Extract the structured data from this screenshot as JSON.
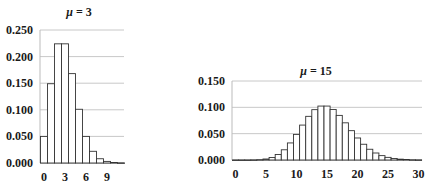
{
  "chart_data": [
    {
      "type": "bar",
      "title": "μ = 3",
      "title_mu": "μ",
      "title_value": "= 3",
      "xlabel": "",
      "ylabel": "",
      "ylim": [
        0,
        0.25
      ],
      "yticks": [
        "0.000",
        "0.050",
        "0.100",
        "0.150",
        "0.200",
        "0.250"
      ],
      "xticks": [
        "0",
        "3",
        "6",
        "9"
      ],
      "grid": true,
      "categories": [
        0,
        1,
        2,
        3,
        4,
        5,
        6,
        7,
        8,
        9,
        10,
        11
      ],
      "values": [
        0.05,
        0.149,
        0.224,
        0.224,
        0.168,
        0.101,
        0.05,
        0.022,
        0.008,
        0.003,
        0.001,
        0.0002
      ]
    },
    {
      "type": "bar",
      "title": "μ = 15",
      "title_mu": "μ",
      "title_value": "= 15",
      "xlabel": "",
      "ylabel": "",
      "ylim": [
        0,
        0.15
      ],
      "yticks": [
        "0.000",
        "0.050",
        "0.100",
        "0.150"
      ],
      "xticks": [
        "0",
        "5",
        "10",
        "15",
        "20",
        "25",
        "30"
      ],
      "grid": true,
      "categories": [
        0,
        1,
        2,
        3,
        4,
        5,
        6,
        7,
        8,
        9,
        10,
        11,
        12,
        13,
        14,
        15,
        16,
        17,
        18,
        19,
        20,
        21,
        22,
        23,
        24,
        25,
        26,
        27,
        28,
        29,
        30
      ],
      "values": [
        0.0,
        0.0,
        0.0,
        0.0002,
        0.0006,
        0.0019,
        0.0048,
        0.0104,
        0.0194,
        0.0324,
        0.0486,
        0.0663,
        0.0829,
        0.0956,
        0.1024,
        0.1024,
        0.096,
        0.0847,
        0.0706,
        0.0557,
        0.0418,
        0.0299,
        0.0204,
        0.0133,
        0.0083,
        0.005,
        0.0029,
        0.0016,
        0.0009,
        0.0004,
        0.0002
      ]
    }
  ]
}
